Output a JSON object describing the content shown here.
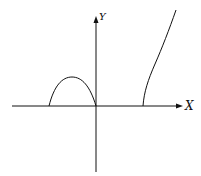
{
  "diagram": {
    "axes": {
      "x_label": "X",
      "y_label": "Y"
    },
    "curves": [
      {
        "name": "arch",
        "description": "hump between negative x-intercept and origin"
      },
      {
        "name": "branch",
        "description": "rising branch starting on positive x-axis"
      }
    ],
    "colors": {
      "stroke": "#111111",
      "background": "#ffffff"
    }
  }
}
